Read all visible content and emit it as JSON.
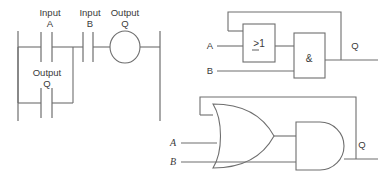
{
  "figure": {
    "background_color": "#ffffff",
    "line_color": "#6e6e6e",
    "text_color": "#3a3a3a"
  },
  "ladder_diagram": {
    "name": "ladder-logic-diagram",
    "labels": {
      "input_a_line1": "Input",
      "input_a_line2": "A",
      "input_b_line1": "Input",
      "input_b_line2": "B",
      "output_q_coil_line1": "Output",
      "output_q_coil_line2": "Q",
      "output_q_contact_line1": "Output",
      "output_q_contact_line2": "Q"
    },
    "rungs": [
      {
        "branch": "top",
        "elements": [
          "contact-input-a",
          "contact-input-b",
          "coil-output-q"
        ]
      },
      {
        "branch": "parallel",
        "elements": [
          "contact-output-q"
        ]
      }
    ]
  },
  "gate_diagram_iec": {
    "name": "iec-symbol-logic-diagram",
    "or_gate_label": ">1",
    "and_gate_label": "&",
    "input_a_label": "A",
    "input_b_label": "B",
    "output_label": "Q",
    "feedback": "output Q fed back to OR gate input"
  },
  "gate_diagram_ansi": {
    "name": "ansi-symbol-logic-diagram",
    "or_gate_label": "OR",
    "and_gate_label": "AND",
    "input_a_label": "A",
    "input_b_label": "B",
    "output_label": "Q",
    "feedback": "output Q fed back to OR gate input"
  }
}
